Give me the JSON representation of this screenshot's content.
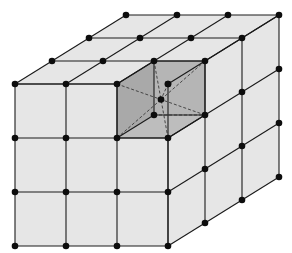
{
  "diagram": {
    "title": "Cubic crystal lattice with highlighted unit cell",
    "grid_size": [
      3,
      3,
      3
    ],
    "colors": {
      "background": "#ffffff",
      "face_fill": "#e6e6e6",
      "highlight_fill": "#b5b5b5",
      "line": "#1a1a1a",
      "node": "#0d0d0d"
    },
    "projection": {
      "origin": [
        15,
        246
      ],
      "x_step": [
        51,
        0
      ],
      "y_step": [
        0,
        -54
      ],
      "z_step": [
        37,
        -23
      ]
    },
    "highlighted_cell": {
      "label": "unit cell",
      "position": [
        2,
        2,
        0
      ],
      "center_atom": true
    },
    "node_count_visible": 52
  }
}
